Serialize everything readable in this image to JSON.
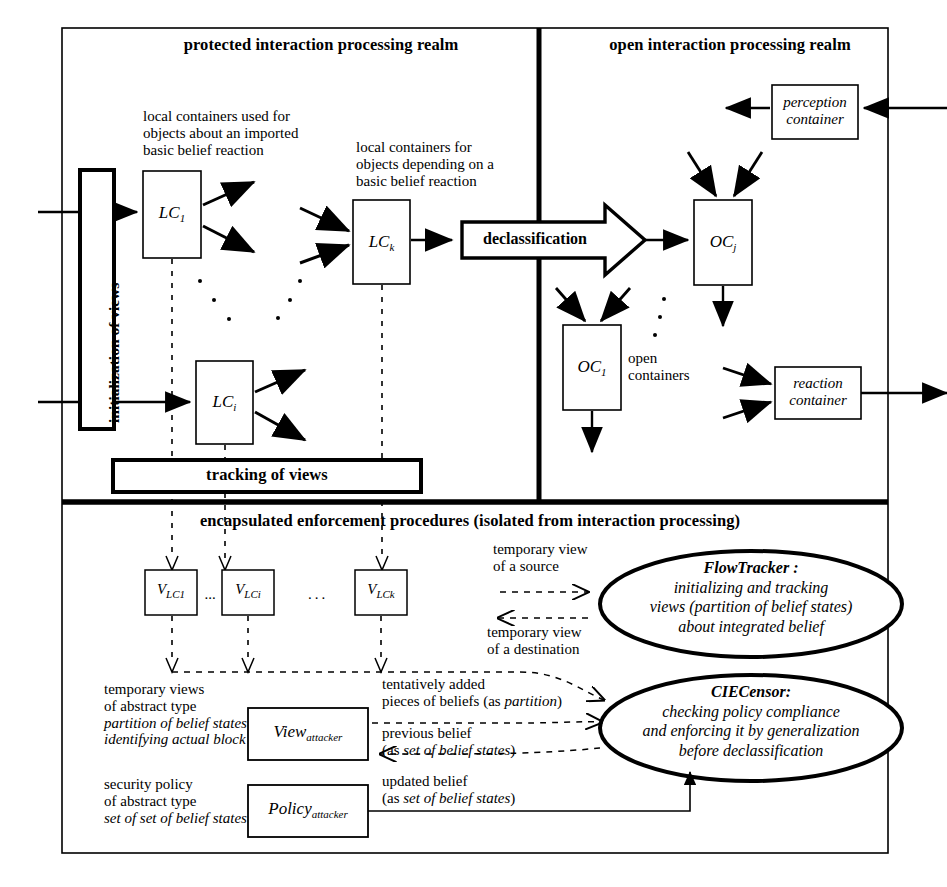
{
  "diagram": {
    "realms": {
      "protected_label": "protected interaction processing realm",
      "open_label": "open interaction processing realm",
      "enforcement_label": "encapsulated enforcement procedures (isolated from interaction processing)"
    },
    "bars": {
      "initialization": "initialization of views",
      "tracking": "tracking of views",
      "declassification": "declassification"
    },
    "annotations": {
      "local_containers_imported": "local  containers  used for\nobjects about an imported\nbasic belief reaction",
      "local_containers_imported_lines": [
        "local  containers  used for",
        "objects about an imported",
        "basic belief reaction"
      ],
      "local_containers_depending_lines": [
        "local containers for",
        "objects depending on a",
        "basic belief reaction"
      ],
      "open_containers_lines": [
        "open",
        "containers"
      ],
      "temporary_view_source_lines": [
        "temporary view",
        "of a source"
      ],
      "temporary_view_destination_lines": [
        "temporary view",
        "of a destination"
      ],
      "temporary_views_abstract_lines_plain": [
        "temporary views",
        "of abstract type"
      ],
      "temporary_views_abstract_lines_italic": [
        "partition of belief states",
        "identifying actual block"
      ],
      "security_policy_lines_plain": [
        "security policy",
        "of abstract type"
      ],
      "security_policy_lines_italic": [
        "set of set of belief states"
      ],
      "tentatively_added_line1": "tentatively added",
      "tentatively_added_line2_pre": "pieces of beliefs (as ",
      "tentatively_added_line2_ital": "partition",
      "tentatively_added_line2_post": ")",
      "previous_belief_line1": "previous  belief",
      "previous_belief_line2_pre": "(as ",
      "previous_belief_line2_ital": "set of belief states",
      "previous_belief_line2_post": ")",
      "updated_belief_line1": "updated  belief",
      "updated_belief_line2_pre": "(as ",
      "updated_belief_line2_ital": "set of belief states",
      "updated_belief_line2_post": ")"
    },
    "containers": [
      {
        "name": "LC_1",
        "base": "LC",
        "sub": "1"
      },
      {
        "name": "LC_k",
        "base": "LC",
        "sub": "k"
      },
      {
        "name": "LC_i",
        "base": "LC",
        "sub": "i"
      },
      {
        "name": "OC_j",
        "base": "OC",
        "sub": "j"
      },
      {
        "name": "OC_1",
        "base": "OC",
        "sub": "1"
      }
    ],
    "named_boxes": {
      "perception_container_lines": [
        "perception",
        "container"
      ],
      "reaction_container_lines": [
        "reaction",
        "container"
      ],
      "view_attacker_base": "View",
      "view_attacker_sub": "attacker",
      "policy_attacker_base": "Policy",
      "policy_attacker_sub": "attacker"
    },
    "view_boxes": [
      {
        "base": "V",
        "sub": "LC1"
      },
      {
        "base": "V",
        "sub": "LCi"
      },
      {
        "base": "V",
        "sub": "LCk"
      }
    ],
    "ellipsis_between_views": "...",
    "ellipsis_wide": "· · ·",
    "modules": {
      "flowtracker": {
        "title": "FlowTracker :",
        "lines": [
          "initializing and tracking",
          "views (partition of belief states)",
          "about integrated belief"
        ]
      },
      "ciecensor": {
        "title": "CIECensor:",
        "lines": [
          "checking policy compliance",
          "and enforcing it by generalization",
          "before declassification"
        ]
      }
    },
    "colors": {
      "stroke": "#000000",
      "background": "#ffffff",
      "dashed": "#000000"
    }
  }
}
